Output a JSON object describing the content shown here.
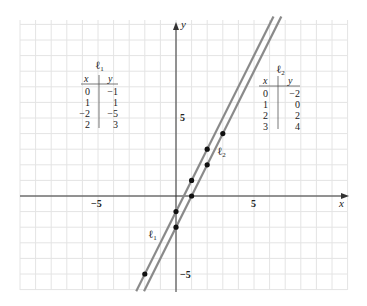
{
  "chart_data": {
    "type": "line",
    "title": "",
    "xlabel": "x",
    "ylabel": "y",
    "xlim": [
      -10,
      11
    ],
    "ylim": [
      -6,
      11
    ],
    "grid": true,
    "x_ticks_labeled": [
      {
        "value": -5,
        "label": "−5"
      },
      {
        "value": 5,
        "label": "5"
      }
    ],
    "y_ticks_labeled": [
      {
        "value": 5,
        "label": "5"
      },
      {
        "value": -5,
        "label": "−5"
      }
    ],
    "series": [
      {
        "name": "ℓ1",
        "equation": "y = 2x − 1",
        "points": [
          {
            "x": 0,
            "y": -1
          },
          {
            "x": 1,
            "y": 1
          },
          {
            "x": -2,
            "y": -5
          },
          {
            "x": 2,
            "y": 3
          }
        ]
      },
      {
        "name": "ℓ2",
        "equation": "y = 2x − 2",
        "points": [
          {
            "x": 0,
            "y": -2
          },
          {
            "x": 1,
            "y": 0
          },
          {
            "x": 2,
            "y": 2
          },
          {
            "x": 3,
            "y": 4
          }
        ]
      }
    ]
  },
  "tables": {
    "l1": {
      "title": "ℓ1",
      "title_main": "ℓ",
      "title_sub": "1",
      "headers": [
        "x",
        "y"
      ],
      "rows": [
        [
          "0",
          "−1"
        ],
        [
          "1",
          "1"
        ],
        [
          "−2",
          "−5"
        ],
        [
          "2",
          "3"
        ]
      ]
    },
    "l2": {
      "title": "ℓ2",
      "title_main": "ℓ",
      "title_sub": "2",
      "headers": [
        "x",
        "y"
      ],
      "rows": [
        [
          "0",
          "−2"
        ],
        [
          "1",
          "0"
        ],
        [
          "2",
          "2"
        ],
        [
          "3",
          "4"
        ]
      ]
    }
  },
  "labels": {
    "line1_main": "ℓ",
    "line1_sub": "1",
    "line2_main": "ℓ",
    "line2_sub": "2",
    "x_axis": "x",
    "y_axis": "y",
    "tick_x_neg5": "−5",
    "tick_x_pos5": "5",
    "tick_y_pos5": "5",
    "tick_y_neg5": "−5"
  },
  "colors": {
    "grid": "#e4e4e4",
    "axis": "#333333",
    "line": "#8a8a8a",
    "point": "#111111"
  }
}
